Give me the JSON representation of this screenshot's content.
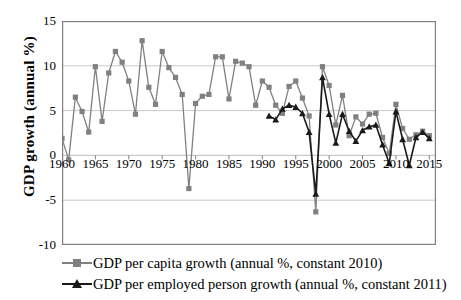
{
  "chart_data": {
    "type": "line",
    "title": "",
    "xlabel": "",
    "ylabel": "GDP growth (annual %)",
    "ylim": [
      -10,
      15
    ],
    "yticks": [
      15,
      10,
      5,
      0,
      -5,
      -10
    ],
    "xlim": [
      1960,
      2016
    ],
    "xticks": [
      1960,
      1965,
      1970,
      1975,
      1980,
      1985,
      1990,
      1995,
      2000,
      2005,
      2010,
      2015
    ],
    "grid": "horizontal",
    "legend_position": "bottom",
    "colors": {
      "gdp_per_capita": "#808080",
      "gdp_per_employed": "#1a1a1a",
      "gridline": "#c8c8c8",
      "axis": "#808080",
      "background": "#ffffff"
    },
    "series": [
      {
        "name": "GDP per capita growth (annual %, constant 2010)",
        "marker": "square",
        "color": "#808080",
        "x": [
          1960,
          1961,
          1962,
          1963,
          1964,
          1965,
          1966,
          1967,
          1968,
          1969,
          1970,
          1971,
          1972,
          1973,
          1974,
          1975,
          1976,
          1977,
          1978,
          1979,
          1980,
          1981,
          1982,
          1983,
          1984,
          1985,
          1986,
          1987,
          1988,
          1989,
          1990,
          1991,
          1992,
          1993,
          1994,
          1995,
          1996,
          1997,
          1998,
          1999,
          2000,
          2001,
          2002,
          2003,
          2004,
          2005,
          2006,
          2007,
          2008,
          2009,
          2010,
          2011,
          2012,
          2013,
          2014,
          2015
        ],
        "values": [
          1.9,
          -0.5,
          6.5,
          4.9,
          2.6,
          9.9,
          3.8,
          9.2,
          11.6,
          10.4,
          8.3,
          4.6,
          12.8,
          7.6,
          5.7,
          11.6,
          9.8,
          8.7,
          6.8,
          -3.7,
          5.8,
          6.6,
          6.8,
          11.0,
          11.0,
          6.3,
          10.5,
          10.3,
          9.9,
          5.6,
          8.3,
          7.6,
          5.6,
          4.7,
          7.7,
          8.3,
          6.4,
          4.4,
          -6.3,
          9.9,
          7.8,
          3.4,
          6.7,
          2.2,
          4.3,
          3.5,
          4.6,
          4.7,
          2.0,
          0.2,
          5.7,
          3.0,
          1.8,
          2.3,
          2.7,
          2.2
        ]
      },
      {
        "name": "GDP per employed person growth (annual %, constant 2011)",
        "marker": "triangle",
        "color": "#1a1a1a",
        "x": [
          1991,
          1992,
          1993,
          1994,
          1995,
          1996,
          1997,
          1998,
          1999,
          2000,
          2001,
          2002,
          2003,
          2004,
          2005,
          2006,
          2007,
          2008,
          2009,
          2010,
          2011,
          2012,
          2013,
          2014,
          2015
        ],
        "values": [
          4.4,
          4.0,
          5.2,
          5.6,
          5.4,
          4.7,
          2.6,
          -4.3,
          8.7,
          4.6,
          1.4,
          4.6,
          2.7,
          1.6,
          2.8,
          3.2,
          3.4,
          1.2,
          -0.9,
          4.9,
          1.8,
          -1.1,
          2.0,
          2.6,
          1.9
        ]
      }
    ]
  },
  "legend": {
    "items": [
      {
        "label": "GDP per capita growth (annual %, constant 2010)",
        "marker": "square",
        "color": "#808080"
      },
      {
        "label": "GDP per employed person growth (annual %, constant 2011)",
        "marker": "triangle",
        "color": "#1a1a1a"
      }
    ]
  }
}
